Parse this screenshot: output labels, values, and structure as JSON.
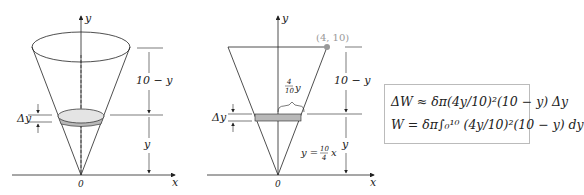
{
  "left_figure": {
    "axis_y": "y",
    "axis_x": "x",
    "origin": "0",
    "dim_top": "10 − y",
    "dim_bottom": "y",
    "slice_label": "Δy"
  },
  "right_figure": {
    "axis_y": "y",
    "axis_x": "x",
    "origin": "0",
    "point": "(4, 10)",
    "radius_label_num": "4",
    "radius_label_den": "10",
    "radius_label_var": "y",
    "dim_top": "10 − y",
    "dim_bottom": "y",
    "slice_label": "Δy",
    "line_eq_lhs": "y =",
    "line_eq_num": "10",
    "line_eq_den": "4",
    "line_eq_var": "x"
  },
  "formulas": {
    "line1": "ΔW ≈ δπ(4y/10)²(10 − y) Δy",
    "line2": "W = δπ∫₀¹⁰ (4y/10)²(10 − y) dy"
  },
  "colors": {
    "slice_fill": "#b8b8b8",
    "point": "#999999",
    "line": "#222222"
  }
}
